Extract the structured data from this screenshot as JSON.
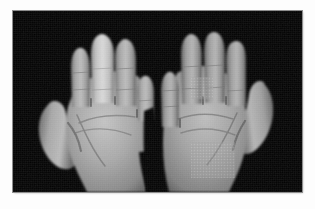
{
  "document": {
    "kind": "clinical-photograph",
    "modality": "Colour photograph, reproduced in greyscale halftone",
    "caption": ""
  },
  "frame": {
    "page_background": "#fdfdfd",
    "border_color": "#8e8e8e",
    "photo_left": 13,
    "photo_top": 11,
    "photo_width": 289,
    "photo_height": 181
  },
  "photo": {
    "background_color": "#000000",
    "description": "Two hands held side by side, palms facing the viewer, fingers extended upward and slightly spread, against a plain black backdrop. The wrists run off the lower edge of the frame.",
    "view": "Volar (palmar) view, both hands",
    "lighting": "Frontal flash; highlights on the fingertips and thenar eminences, soft shadow in the web spaces",
    "tone_range": {
      "background": "#000000",
      "skin_shadow": "#585858",
      "skin_midtone": "#9b9b9b",
      "skin_light": "#bdbdbd",
      "skin_highlight": "#d6d6d6",
      "crease_line": "#6d6d6d"
    },
    "artifacts": [
      "halftone dot pattern visible over the right hypothenar eminence",
      "halftone dot pattern visible along the right ring-finger proximal phalanx",
      "slight print grain across the whole plate"
    ],
    "subjects": [
      {
        "id": "left-hand",
        "label": "Left hand (viewer's left)",
        "side": "patient right hand, volar view",
        "thumb": "abducted laterally to the far left, tip at approximately one third image height",
        "digits": [
          {
            "name": "index",
            "state": "normal calibre, slightly flexed tip"
          },
          {
            "name": "middle",
            "state": "diffusely swollen, sausage-shaped (dactylitis); markedly wider and brighter than neighbouring digits, loss of normal interphalangeal tapering"
          },
          {
            "name": "ring",
            "state": "normal calibre, shorter in view"
          },
          {
            "name": "little",
            "state": "normal calibre"
          }
        ],
        "palm": "Thenar and hypothenar eminences well defined; distal and proximal palmar creases plus thenar crease clearly visible"
      },
      {
        "id": "right-hand",
        "label": "Right hand (viewer's right)",
        "side": "patient left hand, volar view",
        "thumb": "abducted laterally to the far right, tip higher than the opposite thumb",
        "digits": [
          {
            "name": "index",
            "state": "normal calibre"
          },
          {
            "name": "middle",
            "state": "normal calibre, longest digit"
          },
          {
            "name": "ring",
            "state": "normal calibre"
          },
          {
            "name": "little",
            "state": "normal calibre, shortest"
          }
        ],
        "palm": "Palmar creases visible; halftone mottling across the hypothenar region"
      }
    ],
    "clinical_finding": "Asymmetric swelling of a single digit — the middle finger of the hand on the viewer's left — compared with the uniformly normal digits of the opposite hand"
  }
}
